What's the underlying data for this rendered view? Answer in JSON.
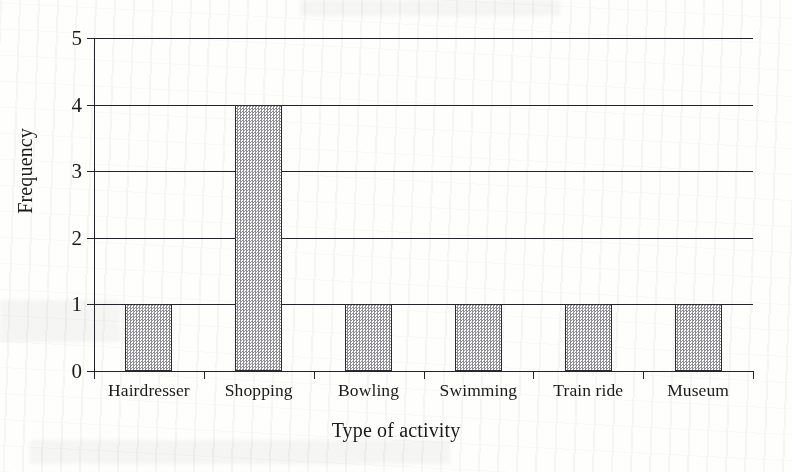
{
  "chart_data": {
    "type": "bar",
    "title": "",
    "subtitle": "",
    "xlabel": "Type of activity",
    "ylabel": "Frequency",
    "categories": [
      "Hairdresser",
      "Shopping",
      "Bowling",
      "Swimming",
      "Train ride",
      "Museum"
    ],
    "values": [
      1,
      4,
      1,
      1,
      1,
      1
    ],
    "ylim": [
      0,
      5
    ],
    "yticks": [
      "0",
      "1",
      "2",
      "3",
      "4",
      "5"
    ],
    "grid": "horizontal",
    "legend": "none",
    "bar_fill": "#9a9a9e",
    "bar_outline": "#2a2a30",
    "axis_color": "#23232a",
    "background": "#fefefc"
  },
  "axes": {
    "y_title": "Frequency",
    "x_title": "Type of activity"
  }
}
